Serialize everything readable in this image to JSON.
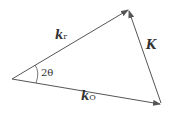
{
  "diagram": {
    "labels": {
      "kr": {
        "main": "k",
        "sub": "r"
      },
      "ko": {
        "main": "k",
        "sub": "O"
      },
      "K": "K",
      "angle": "2θ"
    },
    "stroke_color": "#555555"
  }
}
